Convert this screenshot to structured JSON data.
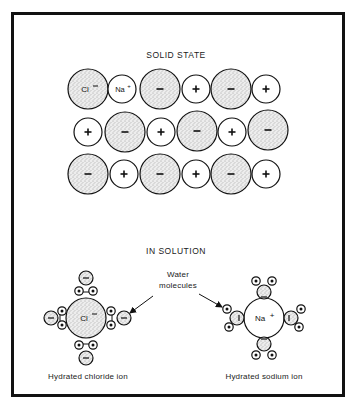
{
  "figure": {
    "section_solid": {
      "title": "SOLID STATE"
    },
    "section_solution": {
      "title": "IN SOLUTION"
    },
    "water_label_line1": "Water",
    "water_label_line2": "molecules",
    "chloride_caption": "Hydrated chloride ion",
    "sodium_caption": "Hydrated sodium ion",
    "chloride_symbol": "Cl",
    "chloride_charge": "−",
    "sodium_symbol": "Na",
    "sodium_charge": "+",
    "lattice": {
      "rows": [
        [
          "Cl−",
          "Na+",
          "−",
          "+",
          "−",
          "+"
        ],
        [
          "+",
          "−",
          "+",
          "−",
          "+",
          "−"
        ],
        [
          "−",
          "+",
          "−",
          "+",
          "−",
          "+"
        ]
      ],
      "legend": {
        "anion": "large stippled circle (chloride, −)",
        "cation": "small white circle (sodium, +)"
      }
    },
    "colors": {
      "ink": "#111111",
      "stipple_bg": "#ececec",
      "background": "#ffffff"
    }
  }
}
